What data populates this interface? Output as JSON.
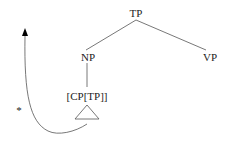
{
  "diagram": {
    "type": "syntax-tree",
    "nodes": {
      "root": {
        "label": "TP"
      },
      "left_child": {
        "label": "NP"
      },
      "right_child": {
        "label": "VP"
      },
      "np_child": {
        "label": "[CP[TP]]"
      }
    },
    "edges": [
      {
        "from": "TP",
        "to": "NP"
      },
      {
        "from": "TP",
        "to": "VP"
      },
      {
        "from": "NP",
        "to": "[CP[TP]]"
      }
    ],
    "triangle": {
      "under": "[CP[TP]]",
      "meaning": "unexpanded subtree"
    },
    "movement_arrow": {
      "from": "[CP[TP]] subtree",
      "direction": "upward",
      "ungrammatical_marker": "*"
    },
    "colors": {
      "text": "#222222",
      "lines": "#555555",
      "arrowhead": "#000000",
      "background": "#ffffff"
    }
  }
}
